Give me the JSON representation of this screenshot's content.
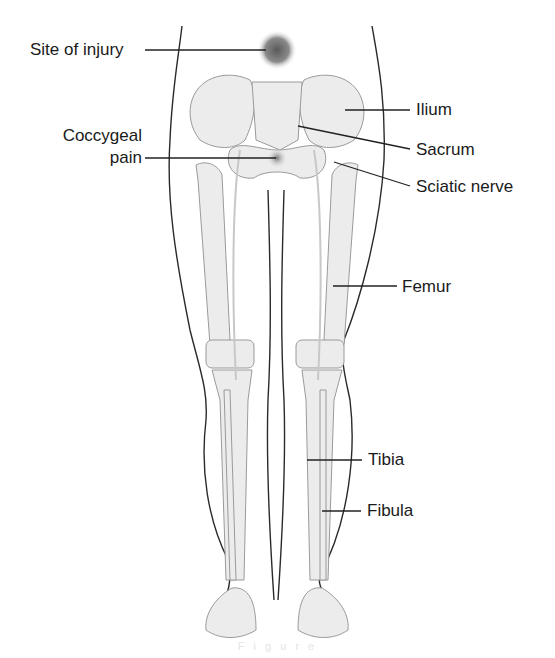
{
  "figure": {
    "labels": {
      "site_of_injury": "Site of injury",
      "coccygeal_pain_line1": "Coccygeal",
      "coccygeal_pain_line2": "pain",
      "ilium": "Ilium",
      "sacrum": "Sacrum",
      "sciatic_nerve": "Sciatic nerve",
      "femur": "Femur",
      "tibia": "Tibia",
      "fibula": "Fibula"
    },
    "caption": "F i g u r e"
  },
  "colors": {
    "background": "#ffffff",
    "text": "#1a1a1a",
    "outline": "#2a2a2a",
    "bone": "#ececec",
    "injury_spot": "#6e6e6e"
  }
}
